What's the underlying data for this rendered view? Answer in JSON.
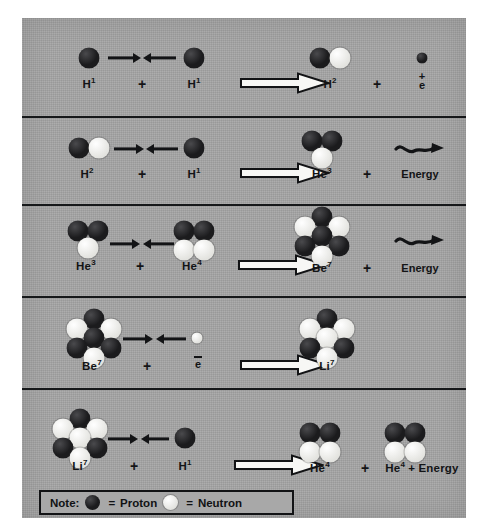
{
  "figure": {
    "panel_color": "#a6a6a6",
    "proton_color": "#1b1b1d",
    "neutron_color": "#f4f4f2",
    "line_color": "#16181a"
  },
  "legend": {
    "note_label": "Note:",
    "proton_equals": "=",
    "proton_label": "Proton",
    "neutron_equals": "=",
    "neutron_label": "Neutron"
  },
  "rows": [
    {
      "id": "row-1",
      "reactant_a_label": "H",
      "reactant_a_sup": "1",
      "plus_1": "+",
      "reactant_b_label": "H",
      "reactant_b_sup": "1",
      "product_a_label": "H",
      "product_a_sup": "2",
      "plus_2": "+",
      "product_b_sign": "+",
      "product_b_sym": "e",
      "equation": "H1 + H1 -> H2 + positron"
    },
    {
      "id": "row-2",
      "reactant_a_label": "H",
      "reactant_a_sup": "2",
      "plus_1": "+",
      "reactant_b_label": "H",
      "reactant_b_sup": "1",
      "product_a_label": "He",
      "product_a_sup": "3",
      "plus_2": "+",
      "product_b_label": "Energy",
      "equation": "H2 + H1 -> He3 + Energy"
    },
    {
      "id": "row-3",
      "reactant_a_label": "He",
      "reactant_a_sup": "3",
      "plus_1": "+",
      "reactant_b_label": "He",
      "reactant_b_sup": "4",
      "product_a_label": "Be",
      "product_a_sup": "7",
      "plus_2": "+",
      "product_b_label": "Energy",
      "equation": "He3 + He4 -> Be7 + Energy"
    },
    {
      "id": "row-4",
      "reactant_a_label": "Be",
      "reactant_a_sup": "7",
      "plus_1": "+",
      "reactant_b_sym": "e",
      "product_a_label": "Li",
      "product_a_sup": "7",
      "equation": "Be7 + electron -> Li7"
    },
    {
      "id": "row-5",
      "reactant_a_label": "Li",
      "reactant_a_sup": "7",
      "plus_1": "+",
      "reactant_b_label": "H",
      "reactant_b_sup": "1",
      "product_a_label": "He",
      "product_a_sup": "4",
      "plus_2": "+",
      "product_b_label": "He",
      "product_b_sup": "4",
      "product_b_tail": "+ Energy",
      "equation": "Li7 + H1 -> He4 + He4 + Energy"
    }
  ]
}
